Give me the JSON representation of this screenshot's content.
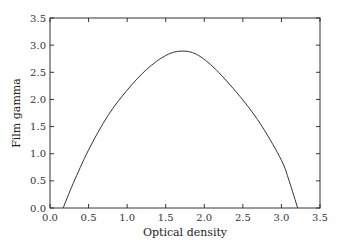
{
  "chart_data": {
    "type": "line",
    "title": "",
    "xlabel": "Optical density",
    "ylabel": "Film gamma",
    "xlim": [
      0.0,
      3.5
    ],
    "ylim": [
      0.0,
      3.5
    ],
    "grid": false,
    "legend": null,
    "xticks": [
      "0.0",
      "0.5",
      "1.0",
      "1.5",
      "2.0",
      "2.5",
      "3.0",
      "3.5"
    ],
    "yticks": [
      "0.0",
      "0.5",
      "1.0",
      "1.5",
      "2.0",
      "2.5",
      "3.0",
      "3.5"
    ],
    "series": [
      {
        "name": "Film gamma vs optical density",
        "x": [
          0.17,
          0.3,
          0.5,
          0.75,
          1.0,
          1.25,
          1.5,
          1.7,
          1.9,
          2.15,
          2.5,
          2.75,
          3.0,
          3.1,
          3.21
        ],
        "y": [
          0.0,
          0.45,
          1.07,
          1.7,
          2.17,
          2.55,
          2.81,
          2.89,
          2.83,
          2.55,
          1.99,
          1.5,
          0.88,
          0.5,
          0.0
        ]
      }
    ],
    "colors": {
      "line": "#333333",
      "axis": "#333333"
    }
  }
}
